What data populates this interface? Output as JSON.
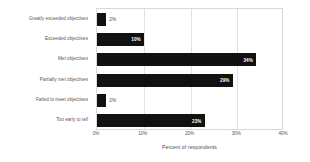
{
  "chart_data": {
    "type": "bar",
    "orientation": "horizontal",
    "title": "",
    "xlabel": "Percent of respondents",
    "ylabel": "",
    "xlim": [
      0,
      40
    ],
    "xticks": [
      "0%",
      "10%",
      "20%",
      "30%",
      "40%"
    ],
    "xtick_values": [
      0,
      10,
      20,
      30,
      40
    ],
    "grid": true,
    "grid_axis": "x",
    "legend": false,
    "bar_color": "#111111",
    "categories": [
      "Greatly exceeded objectives",
      "Exceeded objectives",
      "Met objectives",
      "Partially met objectives",
      "Failed to meet objectives",
      "Too early to tell"
    ],
    "values": [
      2,
      10,
      34,
      29,
      2,
      23
    ],
    "data_labels": [
      "2%",
      "10%",
      "34%",
      "29%",
      "2%",
      "23%"
    ],
    "label_placement": [
      "outside",
      "inside",
      "inside",
      "inside",
      "outside",
      "inside"
    ]
  }
}
